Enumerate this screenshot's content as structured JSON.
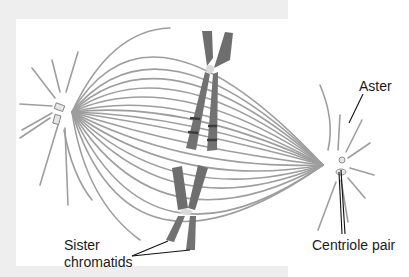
{
  "figure": {
    "colors": {
      "frame": "#eeeeee",
      "background": "#ffffff",
      "microtubule": "#9a9a9a",
      "chromosome": "#6e6e6e",
      "chromosome_band": "#3c3c3c",
      "centromere": "#d9d9d9",
      "leader_line": "#111111",
      "label_text": "#1a1a1a"
    },
    "structures": {
      "left_pole": {
        "x": 72,
        "y": 112
      },
      "right_pole": {
        "x": 323,
        "y": 165
      },
      "chromosomes": [
        {
          "name": "upper-chromosome",
          "centromere": {
            "x": 210,
            "y": 68
          }
        },
        {
          "name": "lower-chromosome",
          "centromere": {
            "x": 185,
            "y": 212
          }
        }
      ]
    },
    "labels": {
      "aster": "Aster",
      "centriole_pair": "Centriole pair",
      "sister_line1": "Sister",
      "sister_line2": "chromatids"
    }
  }
}
